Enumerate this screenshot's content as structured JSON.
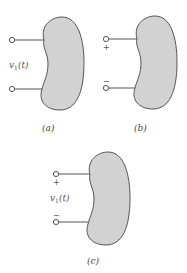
{
  "colors": {
    "blob_fill": "#d2d2d2",
    "blob_stroke": "#555555",
    "wire": "#555555"
  },
  "figures": [
    {
      "id": "a",
      "caption": "(a)",
      "voltage_label": "v1(t)",
      "voltage_label_main": "v",
      "voltage_label_sub": "1",
      "voltage_label_arg": "(t)",
      "plus": "",
      "minus": ""
    },
    {
      "id": "b",
      "caption": "(b)",
      "plus": "+",
      "minus": "−"
    },
    {
      "id": "c",
      "caption": "(c)",
      "voltage_label_main": "v",
      "voltage_label_sub": "1",
      "voltage_label_arg": "(t)",
      "plus": "+",
      "minus": "−"
    }
  ]
}
